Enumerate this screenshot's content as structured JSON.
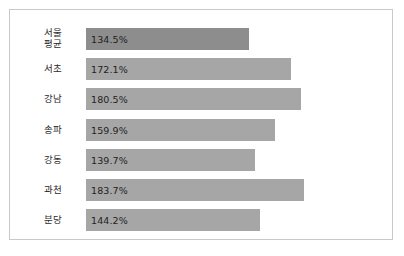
{
  "frame": {
    "border_color": "#c9c9c9",
    "background": "#ffffff"
  },
  "chart_data": {
    "type": "bar",
    "orientation": "horizontal",
    "title": "",
    "subtitle": "",
    "xlabel": "",
    "ylabel": "",
    "grid": false,
    "legend": "none",
    "axis_note": "horizontal bars, value axis does not start at zero",
    "categories": [
      "서울\n평균",
      "서초",
      "강남",
      "송파",
      "강동",
      "과천",
      "분당"
    ],
    "values": [
      134.5,
      172.1,
      180.5,
      159.9,
      139.7,
      183.7,
      144.2
    ],
    "value_labels": [
      "134.5%",
      "172.1%",
      "180.5%",
      "159.9%",
      "139.7%",
      "183.7%",
      "144.2%"
    ],
    "colors": [
      "#8d8d8d",
      "#a6a6a6",
      "#a6a6a6",
      "#a6a6a6",
      "#a6a6a6",
      "#a6a6a6",
      "#a6a6a6"
    ]
  },
  "rows": [
    {
      "label_lines": [
        "서울",
        "평균"
      ],
      "value_label": "134.5%",
      "bar_width_px": 163,
      "color": "#8d8d8d",
      "top_px": 18
    },
    {
      "label_lines": [
        "서초"
      ],
      "value_label": "172.1%",
      "bar_width_px": 205,
      "color": "#a6a6a6",
      "top_px": 48
    },
    {
      "label_lines": [
        "강남"
      ],
      "value_label": "180.5%",
      "bar_width_px": 215,
      "color": "#a6a6a6",
      "top_px": 78
    },
    {
      "label_lines": [
        "송파"
      ],
      "value_label": "159.9%",
      "bar_width_px": 189,
      "color": "#a6a6a6",
      "top_px": 109
    },
    {
      "label_lines": [
        "강동"
      ],
      "value_label": "139.7%",
      "bar_width_px": 169,
      "color": "#a6a6a6",
      "top_px": 139
    },
    {
      "label_lines": [
        "과천"
      ],
      "value_label": "183.7%",
      "bar_width_px": 218,
      "color": "#a6a6a6",
      "top_px": 169
    },
    {
      "label_lines": [
        "분당"
      ],
      "value_label": "144.2%",
      "bar_width_px": 174,
      "color": "#a6a6a6",
      "top_px": 199
    }
  ]
}
